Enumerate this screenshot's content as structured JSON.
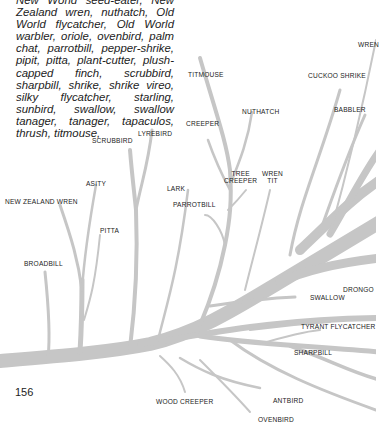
{
  "page": {
    "paragraph": "New World seed-eater, New Zealand wren, nuthatch, Old World flycatcher, Old World warbler, oriole, ovenbird, palm chat, parrotbill, pepper-shrike, pipit, pitta, plant-cutter, plush-capped finch, scrubbird, sharpbill, shrike, shrike vireo, silky flycatcher, starling, sunbird, swallow, swallow tanager, tanager, tapaculos, thrush, titmouse,",
    "page_number": "156"
  },
  "diagram": {
    "type": "phylogenetic tree",
    "branch_color": "#c6c6c6",
    "labels": {
      "wren": "WREN",
      "cuckoo_shrike": "CUCKOO SHRIKE",
      "titmouse": "TITMOUSE",
      "nuthatch": "NUTHATCH",
      "babbler": "BABBLER",
      "creeper": "CREEPER",
      "lyrebird": "LYREBIRD",
      "scrubbird": "SCRUBBIRD",
      "tree_creeper_1": "TREE",
      "tree_creeper_2": "CREEPER",
      "wren_tit_1": "WREN",
      "wren_tit_2": "TIT",
      "asity": "ASITY",
      "lark": "LARK",
      "parrotbill": "PARROTBILL",
      "new_zealand_wren": "NEW ZEALAND WREN",
      "pitta": "PITTA",
      "broadbill": "BROADBILL",
      "drongo": "DRONGO",
      "swallow": "SWALLOW",
      "tyrant_flycatcher": "TYRANT FLYCATCHER",
      "sharpbill": "SHARPBILL",
      "wood_creeper": "WOOD CREEPER",
      "antbird": "ANTBIRD",
      "ovenbird": "OVENBIRD"
    }
  }
}
